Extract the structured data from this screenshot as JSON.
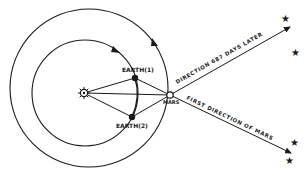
{
  "diagram": {
    "type": "orbital-diagram",
    "labels": {
      "earth1": "EARTH(1)",
      "earth2": "EARTH(2)",
      "mars": "MARS",
      "direction_later": "DIRECTION 687 DAYS LATER",
      "first_direction": "FIRST DIRECTION OF MARS"
    },
    "bodies": [
      {
        "id": "sun",
        "kind": "sun-symbol"
      },
      {
        "id": "earth1",
        "label": "EARTH(1)",
        "kind": "filled-dot"
      },
      {
        "id": "earth2",
        "label": "EARTH(2)",
        "kind": "filled-dot"
      },
      {
        "id": "mars",
        "label": "MARS",
        "kind": "open-circle"
      }
    ],
    "orbits": [
      {
        "id": "earth-orbit",
        "direction": "counter-clockwise"
      },
      {
        "id": "mars-orbit",
        "direction": "counter-clockwise"
      }
    ],
    "stars_count": 4,
    "colors": {
      "ink": "#1a1a1a",
      "background": "#ffffff"
    }
  }
}
